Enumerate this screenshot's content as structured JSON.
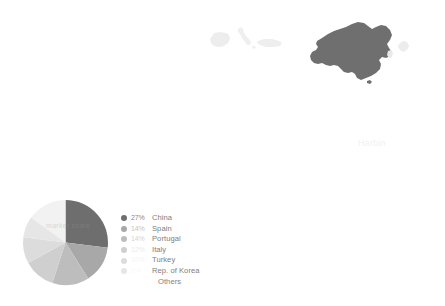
{
  "chart_data": {
    "type": "pie",
    "title": "",
    "categories": [
      "China",
      "Spain",
      "Portugal",
      "Italy",
      "Turkey",
      "Rep. of Korea",
      "Others"
    ],
    "values": [
      27,
      14,
      14,
      12,
      10,
      8,
      15
    ],
    "value_labels": [
      "27%",
      "14%",
      "14%",
      "",
      "",
      "",
      ""
    ],
    "colors": [
      "#6e6e6e",
      "#a8a8a8",
      "#bdbdbd",
      "#cfcfcf",
      "#dcdcdc",
      "#e6e6e6",
      "#f2f2f2"
    ],
    "legend_position": "right",
    "grid": false,
    "start_angle_deg": 0,
    "xlabel": "",
    "ylabel": ""
  },
  "legend": {
    "rows": [
      {
        "pct": "27%",
        "label": "China",
        "dot": "#6e6e6e",
        "pct_color": "#8a8a8a"
      },
      {
        "pct": "14%",
        "label": "Spain",
        "dot": "#a8a8a8",
        "pct_color": "#c4c4c4"
      },
      {
        "pct": "14%",
        "label": "Portugal",
        "dot": "#bdbdbd",
        "pct_color": "#d4d4d4"
      },
      {
        "pct": "12%",
        "label": "Italy",
        "dot": "#cfcfcf",
        "pct_color": "#ebebeb"
      },
      {
        "pct": "10%",
        "label": "Turkey",
        "dot": "#dcdcdc",
        "pct_color": "#f4f4f4"
      },
      {
        "pct": "8%",
        "label": "Rep. of Korea",
        "dot": "#e6e6e6",
        "pct_color": "#fafafa"
      },
      {
        "pct": "",
        "label": "Others",
        "dot": "#f2f2f2",
        "pct_color": "#ffffff"
      }
    ]
  },
  "map": {
    "regions": [
      {
        "name": "iberian-peninsula",
        "shade": "#ededed"
      },
      {
        "name": "italy",
        "shade": "#efefef"
      },
      {
        "name": "turkey",
        "shade": "#eeeeee"
      },
      {
        "name": "china",
        "shade": "#6f6f6f"
      },
      {
        "name": "korea",
        "shade": "#e9e9e9"
      },
      {
        "name": "japan",
        "shade": "#ececec"
      }
    ]
  },
  "overlay": {
    "pie_ghost_text": "market share",
    "right_ghost_text": "Harbin"
  },
  "palette": {
    "background": "#ffffff",
    "accent_dark": "#6e6e6e",
    "text": "#808080"
  }
}
